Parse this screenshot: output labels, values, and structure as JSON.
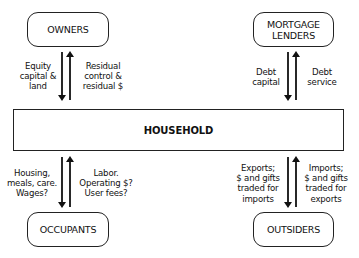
{
  "diagram": {
    "center": {
      "label": "HOUSEHOLD"
    },
    "nodes": {
      "owners": {
        "label": "OWNERS"
      },
      "mortgage_lenders": {
        "line1": "MORTGAGE",
        "line2": "LENDERS"
      },
      "occupants": {
        "label": "OCCUPANTS"
      },
      "outsiders": {
        "label": "OUTSIDERS"
      }
    },
    "flows": {
      "owners_to_household": {
        "lines": [
          "Equity",
          "capital &",
          "land"
        ]
      },
      "household_to_owners": {
        "lines": [
          "Residual",
          "control &",
          "residual $"
        ]
      },
      "lenders_to_household": {
        "lines": [
          "Debt",
          "capital"
        ]
      },
      "household_to_lenders": {
        "lines": [
          "Debt",
          "service"
        ]
      },
      "household_to_occupants": {
        "lines": [
          "Housing,",
          "meals, care.",
          "Wages?"
        ]
      },
      "occupants_to_household": {
        "lines": [
          "Labor.",
          "Operating $?",
          "User fees?"
        ]
      },
      "household_to_outsiders": {
        "lines": [
          "Exports;",
          "$ and gifts",
          "traded for",
          "imports"
        ]
      },
      "outsiders_to_household": {
        "lines": [
          "Imports;",
          "$ and gifts",
          "traded for",
          "exports"
        ]
      }
    }
  }
}
